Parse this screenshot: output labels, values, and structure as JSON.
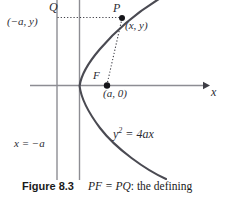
{
  "figure": {
    "caption_number": "Figure 8.3",
    "caption_text_math": "PF = PQ",
    "caption_text_rest": ": the defining",
    "labels": {
      "q_point": "Q",
      "q_coords": "(−a, y)",
      "p_point": "P",
      "p_coords": "(x, y)",
      "focus_point": "F",
      "focus_coords": "(a, 0)",
      "x_axis": "x",
      "directrix": "x = −a",
      "curve_equation_base": "y",
      "curve_equation_exponent": "2",
      "curve_equation_rhs": "= 4ax"
    },
    "colors": {
      "axis": "#8d8d93",
      "curve": "#4a4a52",
      "dotted": "#4a4a52",
      "point": "#1a1a1a",
      "text": "#2b2b33",
      "background": "#ffffff"
    },
    "geometry": {
      "directrix_x": 57,
      "y_axis_x": 79.5,
      "x_axis_y": 85.5,
      "vertex": [
        79.5,
        86
      ],
      "focus": [
        107,
        85.5
      ],
      "point_p": [
        122,
        18
      ],
      "x_axis_arrow_end": [
        208,
        85.5
      ]
    }
  }
}
